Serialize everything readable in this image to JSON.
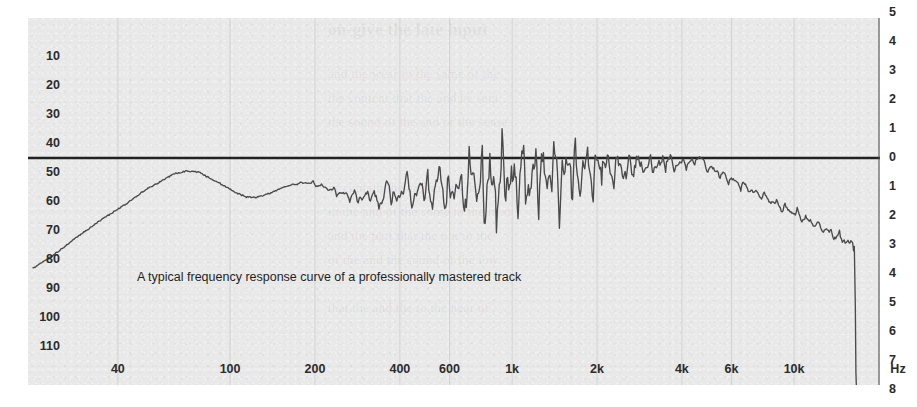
{
  "figure": {
    "caption": "A typical frequency response curve of a professionally mastered track",
    "background_color": "#e9e9e9",
    "curve_color": "#4a4a4a",
    "zero_line_color": "#222222",
    "grid_color": "#d2d2d2",
    "text_color": "#2b2b2b"
  },
  "ghost_text": {
    "line1": "on-give the late input",
    "line2": "and the wear to the same of the",
    "line3": "the content that the and be sent",
    "line4": "the sound of the and or the sense",
    "line5": "or contain the and the to the more",
    "line6": "in the and of the some in the next",
    "line7": "and the part that the out to the",
    "line8": "of the and the sound of the low",
    "line9": "that the and the to the near of"
  },
  "axes": {
    "left_ticks": [
      "10",
      "20",
      "30",
      "40",
      "50",
      "60",
      "70",
      "80",
      "90",
      "100",
      "110"
    ],
    "right_ticks": [
      "5",
      "4",
      "3",
      "2",
      "1",
      "0",
      "1",
      "2",
      "3",
      "4",
      "5",
      "6",
      "7",
      "8"
    ],
    "right_unit": "Hz",
    "bottom_ticks": [
      "40",
      "100",
      "200",
      "400",
      "600",
      "1k",
      "2k",
      "4k",
      "6k",
      "10k"
    ],
    "bottom_unit": "Hz"
  },
  "chart_data": {
    "type": "line",
    "title": "",
    "subtitle": "",
    "annotations": [
      "A typical frequency response curve of a professionally mastered track"
    ],
    "xlabel": "Hz",
    "ylabel": "dB",
    "x_scale": "log",
    "xlim": [
      20,
      20000
    ],
    "grid": true,
    "grid_axis": "x",
    "legend": "none",
    "left_axis": {
      "ticks": [
        10,
        20,
        30,
        40,
        50,
        60,
        70,
        80,
        90,
        100,
        110
      ],
      "note": "level scale, descending magnitude downward"
    },
    "right_axis": {
      "ticks": [
        5,
        4,
        3,
        2,
        1,
        0,
        1,
        2,
        3,
        4,
        5,
        6,
        7,
        8
      ],
      "zero_at": 0,
      "note": "relative dB, 0 at the heavy horizontal reference line"
    },
    "x_tick_values": [
      40,
      100,
      200,
      400,
      600,
      1000,
      2000,
      4000,
      6000,
      10000
    ],
    "series": [
      {
        "name": "Frequency response",
        "x": [
          20,
          24,
          28,
          33,
          38,
          44,
          50,
          57,
          63,
          70,
          78,
          85,
          95,
          105,
          115,
          125,
          140,
          155,
          170,
          185,
          200,
          215,
          235,
          255,
          275,
          295,
          315,
          340,
          365,
          390,
          420,
          450,
          480,
          515,
          550,
          590,
          630,
          675,
          720,
          770,
          825,
          880,
          940,
          1000,
          1070,
          1150,
          1230,
          1310,
          1400,
          1500,
          1600,
          1710,
          1830,
          1950,
          2090,
          2230,
          2380,
          2550,
          2720,
          2910,
          3110,
          3320,
          3550,
          3790,
          4050,
          4330,
          4620,
          4940,
          5280,
          5640,
          6020,
          6430,
          6870,
          7340,
          7840,
          8370,
          8950,
          9560,
          10200,
          10900,
          11700,
          12500,
          13300,
          14200,
          15200,
          16200,
          16600,
          16900,
          17200
        ],
        "y_db": [
          -3.8,
          -3.3,
          -2.8,
          -2.3,
          -1.9,
          -1.5,
          -1.1,
          -0.8,
          -0.55,
          -0.45,
          -0.5,
          -0.7,
          -0.95,
          -1.2,
          -1.35,
          -1.35,
          -1.2,
          -1.0,
          -0.9,
          -0.85,
          -0.9,
          -1.0,
          -1.15,
          -1.25,
          -1.3,
          -1.4,
          -1.2,
          -1.6,
          -0.9,
          -1.5,
          -0.8,
          -1.5,
          -0.75,
          -1.45,
          -0.6,
          -1.5,
          -0.9,
          -1.3,
          -0.5,
          -1.4,
          -0.7,
          -1.2,
          -0.35,
          -1.1,
          -0.5,
          -0.95,
          -0.2,
          -0.85,
          -0.4,
          -0.75,
          -0.15,
          -0.7,
          -0.3,
          -0.6,
          -0.1,
          -0.5,
          -0.25,
          -0.45,
          -0.05,
          -0.35,
          -0.2,
          -0.3,
          0.0,
          -0.25,
          -0.15,
          -0.2,
          0.05,
          -0.35,
          -0.45,
          -0.6,
          -0.75,
          -0.9,
          -1.05,
          -1.2,
          -1.35,
          -1.5,
          -1.65,
          -1.8,
          -1.95,
          -2.1,
          -2.25,
          -2.4,
          -2.55,
          -2.7,
          -2.85,
          -3.0,
          -4.0,
          -6.0,
          -8.0
        ],
        "notes": "Low-end ramps up from below 20 Hz, broad peak near 65-75 Hz, gentle plateau through mids with increasing peak/dip ripple, level riding the 0 dB reference from ~2 kHz, then a progressive high-frequency roll-off reaching about -3 dB by 15 kHz followed by a steep brickwall cliff near 16 kHz."
      }
    ]
  }
}
